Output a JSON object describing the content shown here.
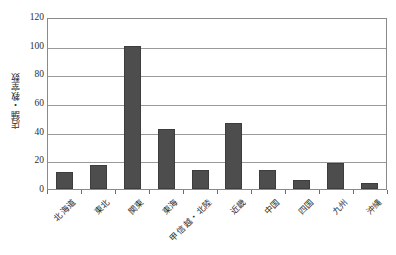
{
  "chart_data": {
    "type": "bar",
    "title": "",
    "subtitle": "",
    "xlabel": "",
    "ylabel": "店舗・教室数",
    "ylim": [
      0,
      120
    ],
    "ytick_values": [
      0,
      20,
      40,
      60,
      80,
      100,
      120
    ],
    "ytick_labels": [
      "0",
      "20",
      "40",
      "60",
      "80",
      "100",
      "120"
    ],
    "grid": true,
    "legend": false,
    "legend_position": "none",
    "categories": [
      "北海道",
      "東北",
      "関東",
      "東海",
      "甲信越・北陸",
      "近畿",
      "中国",
      "四国",
      "九州",
      "沖縄"
    ],
    "values": [
      12,
      17,
      100,
      42,
      13,
      46,
      13,
      6,
      18,
      4
    ],
    "series": [
      {
        "name": "店舗・教室数",
        "values": [
          12,
          17,
          100,
          42,
          13,
          46,
          13,
          6,
          18,
          4
        ]
      }
    ],
    "bar_color": "#4d4d4d",
    "bar_border_color": "#3d3d3d",
    "gridline_color": "#9a9a9a",
    "axis_color": "#8a8a8a",
    "background_color": "#ffffff",
    "text_color": "#2e2e2e"
  }
}
